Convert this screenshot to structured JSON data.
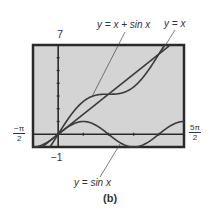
{
  "labels": {
    "ymax": "7",
    "ymin": "−1",
    "xmin_num": "−π",
    "xmin_den": "2",
    "xmax_num": "5π",
    "xmax_den": "2",
    "curve1": "y = x + sin x",
    "curve2": "y = x",
    "curve3": "y = sin x",
    "caption": "(b)"
  },
  "colors": {
    "screen": "#d4d4d4",
    "frame": "#2a2a2a",
    "curve": "#3a3a3a"
  },
  "chart_data": {
    "type": "line",
    "title": "",
    "xlabel": "",
    "ylabel": "",
    "xlim": [
      -1.5708,
      7.854
    ],
    "ylim": [
      -1,
      7
    ],
    "xlim_labels": [
      "-π/2",
      "5π/2"
    ],
    "ylim_labels": [
      "-1",
      "7"
    ],
    "grid": false,
    "series": [
      {
        "name": "y = x + sin x",
        "function": "x + sin(x)"
      },
      {
        "name": "y = x",
        "function": "x"
      },
      {
        "name": "y = sin x",
        "function": "sin(x)"
      }
    ],
    "annotations": [
      "y = x + sin x",
      "y = x",
      "y = sin x"
    ],
    "caption": "(b)"
  }
}
